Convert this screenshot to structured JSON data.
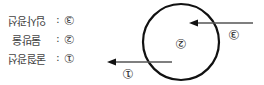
{
  "orientation": "rotated 180 degrees",
  "legend": [
    {
      "number": "③",
      "label": "입사광선"
    },
    {
      "number": "②",
      "label": "물방울"
    },
    {
      "number": "①",
      "label": "굴절광선"
    }
  ],
  "diagram": {
    "labels": {
      "in": "③",
      "center": "②",
      "out": "①"
    },
    "stroke_color": "#111111",
    "line_color": "#555555"
  },
  "separator": ":"
}
